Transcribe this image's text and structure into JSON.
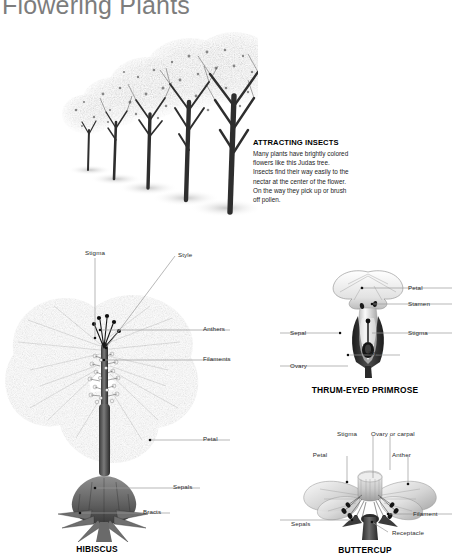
{
  "page": {
    "title": "Flowering Plants",
    "background": "#ffffff",
    "title_color": "#7d7d7d"
  },
  "insect_box": {
    "heading": "ATTRACTING INSECTS",
    "body": "Many plants have brightly colored flowers like this Judas tree. Insects find their way easily to the nectar at the center of the flower. On the way they pick up or brush off pollen."
  },
  "figures": [
    {
      "id": "judas-tree",
      "caption": "",
      "labels": []
    },
    {
      "id": "hibiscus",
      "caption": "HIBISCUS",
      "labels": [
        {
          "text": "Stigma"
        },
        {
          "text": "Style"
        },
        {
          "text": "Anthers"
        },
        {
          "text": "Filaments"
        },
        {
          "text": "Petal"
        },
        {
          "text": "Sepals"
        },
        {
          "text": "Bracts"
        }
      ]
    },
    {
      "id": "thrum-eyed-primrose",
      "caption": "THRUM-EYED PRIMROSE",
      "labels": [
        {
          "text": "Petal"
        },
        {
          "text": "Stamen"
        },
        {
          "text": "Stigma"
        },
        {
          "text": "Style"
        },
        {
          "text": "Sepal"
        },
        {
          "text": "Ovary"
        }
      ]
    },
    {
      "id": "buttercup",
      "caption": "BUTTERCUP",
      "labels": [
        {
          "text": "Stigma"
        },
        {
          "text": "Ovary or carpal"
        },
        {
          "text": "Petal"
        },
        {
          "text": "Anther"
        },
        {
          "text": "Filament"
        },
        {
          "text": "Sepals"
        },
        {
          "text": "Receptacle"
        }
      ]
    }
  ],
  "hibiscus_labels": {
    "stigma": "Stigma",
    "style": "Style",
    "anthers": "Anthers",
    "filaments": "Filaments",
    "petal": "Petal",
    "sepals": "Sepals",
    "bracts": "Bracts",
    "caption": "HIBISCUS"
  },
  "primrose_labels": {
    "petal": "Petal",
    "stamen": "Stamen",
    "stigma": "Stigma",
    "style": "Style",
    "sepal": "Sepal",
    "ovary": "Ovary",
    "caption": "THRUM-EYED PRIMROSE"
  },
  "buttercup_labels": {
    "stigma": "Stigma",
    "ovary": "Ovary or carpal",
    "petal": "Petal",
    "anther": "Anther",
    "filament": "Filament",
    "sepals": "Sepals",
    "receptacle": "Receptacle",
    "caption": "BUTTERCUP"
  }
}
